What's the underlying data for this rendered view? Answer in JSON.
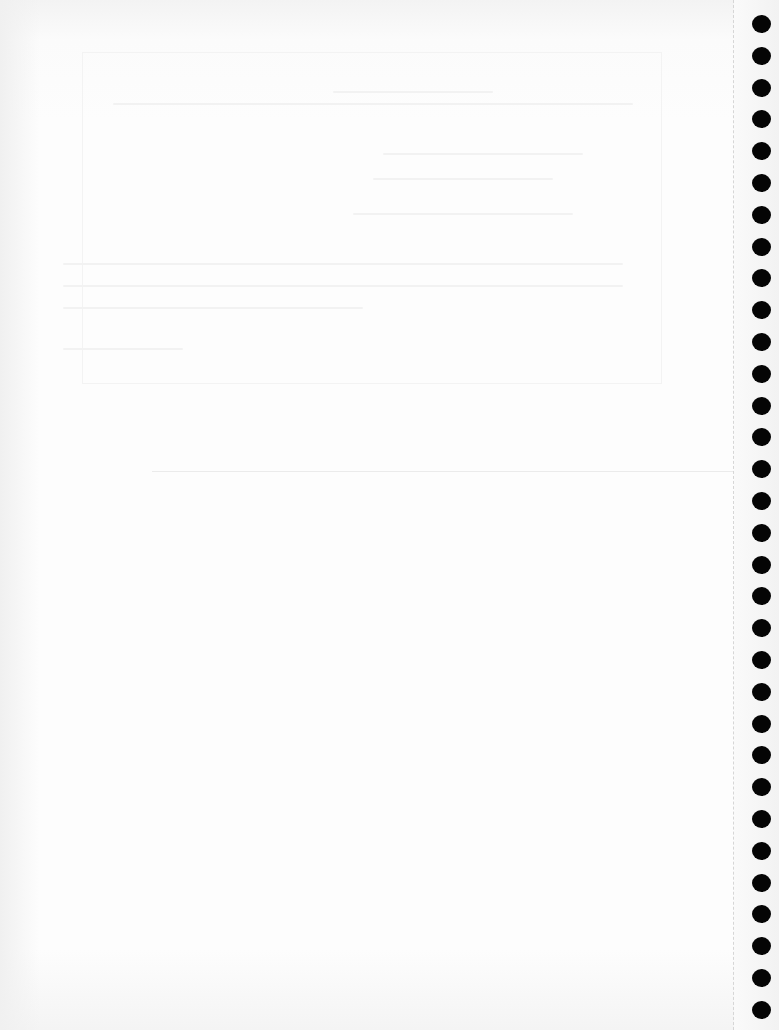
{
  "page": {
    "type": "spiral-notebook-page",
    "background_color": "#fdfdfd",
    "hole_color": "#050505",
    "binding": {
      "side": "right",
      "hole_count": 32,
      "hole_center_x": 761,
      "first_hole_center_y": 24,
      "hole_spacing": 31.8
    },
    "horizontal_rule": {
      "y": 471,
      "x_start": 152,
      "x_end": 734
    },
    "perforation_x": 733,
    "show_through_text_legible": false
  }
}
